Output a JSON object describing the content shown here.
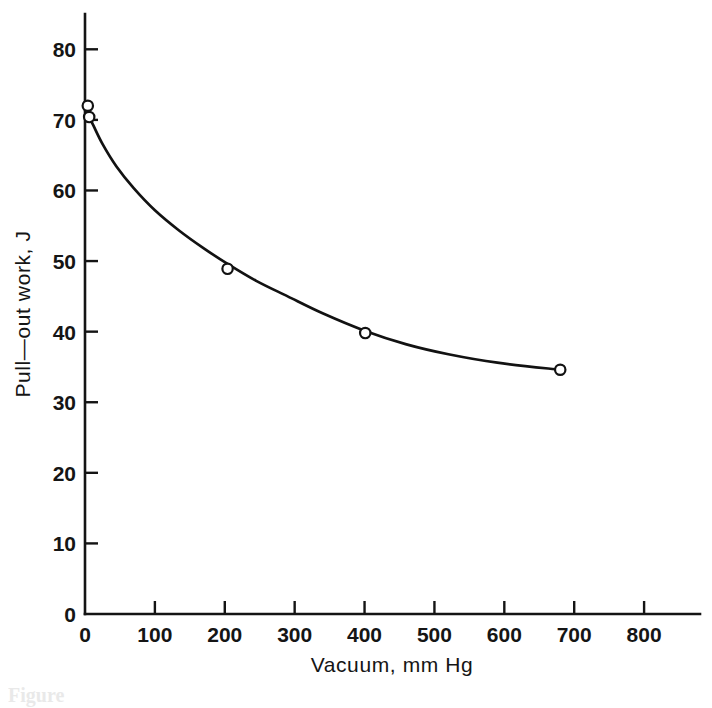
{
  "chart_data": {
    "type": "line",
    "title": "",
    "subtitle": "",
    "xlabel": "Vacuum, mm Hg",
    "ylabel": "Pull—out work, J",
    "xlim": [
      0,
      880
    ],
    "ylim": [
      0,
      85
    ],
    "grid": false,
    "legend": null,
    "x_ticks": [
      0,
      100,
      200,
      300,
      400,
      500,
      600,
      700,
      800
    ],
    "x_tick_labels": [
      "0",
      "100",
      "200",
      "300",
      "400",
      "500",
      "600",
      "700",
      "800"
    ],
    "y_ticks": [
      0,
      10,
      20,
      30,
      40,
      50,
      60,
      70,
      80
    ],
    "y_tick_labels": [
      "0",
      "10",
      "20",
      "30",
      "40",
      "50",
      "60",
      "70",
      "80"
    ],
    "marker_style": "open-circle",
    "series": [
      {
        "name": "Pull-out work vs vacuum",
        "points": [
          {
            "x": 4,
            "y": 72.0
          },
          {
            "x": 6,
            "y": 70.4
          },
          {
            "x": 204,
            "y": 48.9
          },
          {
            "x": 401,
            "y": 39.8
          },
          {
            "x": 680,
            "y": 34.6
          }
        ],
        "curve": [
          {
            "x": 2,
            "y": 71.0
          },
          {
            "x": 10,
            "y": 69.6
          },
          {
            "x": 25,
            "y": 66.6
          },
          {
            "x": 45,
            "y": 63.4
          },
          {
            "x": 70,
            "y": 60.3
          },
          {
            "x": 100,
            "y": 57.2
          },
          {
            "x": 135,
            "y": 54.3
          },
          {
            "x": 170,
            "y": 51.8
          },
          {
            "x": 204,
            "y": 49.6
          },
          {
            "x": 245,
            "y": 47.2
          },
          {
            "x": 290,
            "y": 45.0
          },
          {
            "x": 340,
            "y": 42.6
          },
          {
            "x": 401,
            "y": 40.1
          },
          {
            "x": 460,
            "y": 38.2
          },
          {
            "x": 520,
            "y": 36.8
          },
          {
            "x": 590,
            "y": 35.6
          },
          {
            "x": 680,
            "y": 34.6
          }
        ]
      }
    ]
  },
  "figure": {
    "caption_fragment": "Figure"
  }
}
